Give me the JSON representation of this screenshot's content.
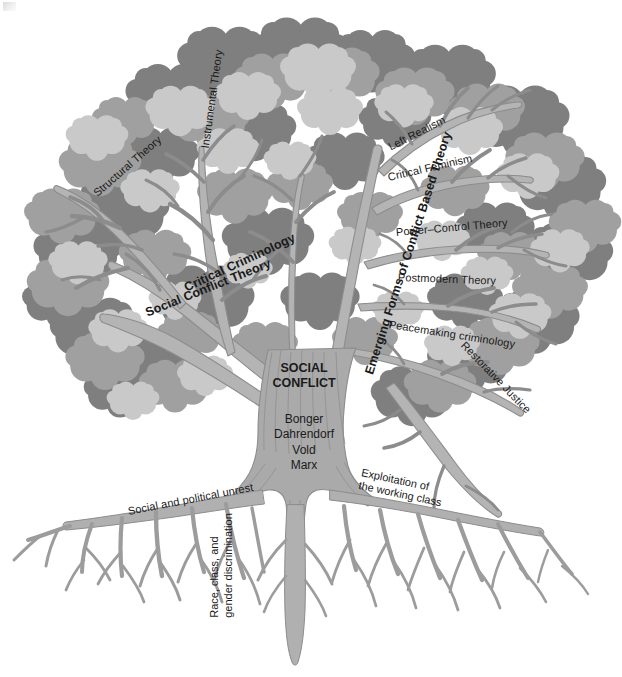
{
  "figure": {
    "kind": "concept-tree",
    "background_color": "#ffffff"
  },
  "palette": {
    "foliage_dark": "#7f7f7f",
    "foliage_mid": "#a0a0a0",
    "foliage_light": "#c9c9c9",
    "branch_fill": "#b4b4b4",
    "branch_outline": "#8c8c8c",
    "trunk_fill": "#aaaaaa",
    "root_fill": "#b0b0b0",
    "text_color": "#1a1a1a"
  },
  "trunk": {
    "core_label": "SOCIAL\nCONFLICT",
    "core_label_line1": "SOCIAL",
    "core_label_line2": "CONFLICT",
    "theorists": [
      "Bonger",
      "Dahrendorf",
      "Vold",
      "Marx"
    ],
    "theorists_block": "Bonger\nDahrendorf\nVold\nMarx"
  },
  "branches": {
    "left_main": [
      {
        "label": "Social Conflict Theory",
        "bold": true,
        "rotate": -22
      },
      {
        "label": "Critical Criminology",
        "bold": true,
        "rotate": -25
      }
    ],
    "left_sub": [
      {
        "label": "Structural Theory",
        "bold": false,
        "rotate": -41
      },
      {
        "label": "Instrumental Theory",
        "bold": false,
        "rotate": -82
      }
    ],
    "right_main": [
      {
        "label": "Emerging Forms of Conflict Based Theory",
        "bold": true,
        "rotate": -72
      }
    ],
    "right_sub": [
      {
        "label": "Left Realism",
        "bold": false,
        "rotate": -27
      },
      {
        "label": "Critical Feminism",
        "bold": false,
        "rotate": -13
      },
      {
        "label": "Power–Control Theory",
        "bold": false,
        "rotate": -5
      },
      {
        "label": "Postmodern Theory",
        "bold": false,
        "rotate": 2
      },
      {
        "label": "Peacemaking criminology",
        "bold": false,
        "rotate": 9
      },
      {
        "label": "Restorative Justice",
        "bold": false,
        "rotate": 46
      }
    ]
  },
  "roots": [
    {
      "label": "Social and political unrest",
      "rotate": -11
    },
    {
      "label": "Exploitation of\nthe working class",
      "line1": "Exploitation of",
      "line2": "the working class",
      "rotate": 12
    },
    {
      "label": "Race, class, and\ngender discrimination",
      "line1": "Race, class, and",
      "line2": "gender discrimination",
      "rotate": -90
    }
  ]
}
